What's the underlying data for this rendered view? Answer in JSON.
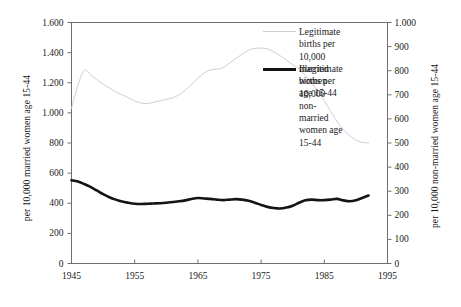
{
  "chart_data": {
    "type": "line",
    "title": "",
    "xlabel": "",
    "ylabel": "per 10,000 married women age 15-44",
    "y2label": "per 10,000 non-married women age 15-44",
    "xlim": [
      1945,
      1995
    ],
    "ylim": [
      0,
      1600
    ],
    "y2lim": [
      0,
      1000
    ],
    "grid": false,
    "legend_position": "top-right inside plot",
    "xticks": [
      1945,
      1955,
      1965,
      1975,
      1985,
      1995
    ],
    "xtick_labels": [
      "1945",
      "1955",
      "1965",
      "1975",
      "1985",
      "1995"
    ],
    "yticks": [
      0,
      200,
      400,
      600,
      800,
      1000,
      1200,
      1400,
      1600
    ],
    "ytick_labels": [
      "0",
      "200",
      "400",
      "600",
      "800",
      "1.000",
      "1.200",
      "1.400",
      "1.600"
    ],
    "y2ticks": [
      0,
      100,
      200,
      300,
      400,
      500,
      600,
      700,
      800,
      900,
      1000
    ],
    "y2tick_labels": [
      "0",
      "100",
      "200",
      "300",
      "400",
      "500",
      "600",
      "700",
      "800",
      "900",
      "1.000"
    ],
    "series": [
      {
        "name": "Legitimate births per 10,000 married women age 15-44",
        "axis": "left",
        "color": "#cfcfcf",
        "width": 1.0,
        "x": [
          1945,
          1946,
          1947,
          1948,
          1949,
          1950,
          1951,
          1952,
          1953,
          1954,
          1955,
          1956,
          1957,
          1958,
          1959,
          1960,
          1961,
          1962,
          1963,
          1964,
          1965,
          1966,
          1967,
          1968,
          1969,
          1970,
          1971,
          1972,
          1973,
          1974,
          1975,
          1976,
          1977,
          1978,
          1979,
          1980,
          1981,
          1982,
          1983,
          1984,
          1985,
          1986,
          1987,
          1988,
          1989,
          1990,
          1991,
          1992
        ],
        "values": [
          1030,
          1180,
          1282,
          1255,
          1220,
          1190,
          1165,
          1140,
          1120,
          1100,
          1080,
          1065,
          1062,
          1070,
          1080,
          1090,
          1100,
          1120,
          1150,
          1190,
          1230,
          1265,
          1285,
          1290,
          1300,
          1330,
          1360,
          1390,
          1415,
          1428,
          1430,
          1425,
          1405,
          1380,
          1350,
          1320,
          1290,
          1250,
          1200,
          1140,
          1080,
          1010,
          945,
          890,
          850,
          820,
          805,
          800
        ]
      },
      {
        "name": "Illegitimate births per 10,000 non-married women age 15-44",
        "axis": "right",
        "color": "#141414",
        "width": 2.6,
        "x": [
          1945,
          1946,
          1947,
          1948,
          1949,
          1950,
          1951,
          1952,
          1953,
          1954,
          1955,
          1956,
          1957,
          1958,
          1959,
          1960,
          1961,
          1962,
          1963,
          1964,
          1965,
          1966,
          1967,
          1968,
          1969,
          1970,
          1971,
          1972,
          1973,
          1974,
          1975,
          1976,
          1977,
          1978,
          1979,
          1980,
          1981,
          1982,
          1983,
          1984,
          1985,
          1986,
          1987,
          1988,
          1989,
          1990,
          1991,
          1992
        ],
        "values": [
          345,
          340,
          330,
          318,
          303,
          288,
          275,
          265,
          257,
          252,
          248,
          247,
          248,
          249,
          250,
          252,
          255,
          258,
          262,
          268,
          272,
          270,
          268,
          265,
          263,
          265,
          267,
          265,
          260,
          252,
          243,
          235,
          230,
          228,
          232,
          240,
          252,
          262,
          265,
          263,
          263,
          265,
          268,
          262,
          258,
          262,
          272,
          282
        ]
      }
    ]
  },
  "legend": {
    "entries": [
      {
        "key": "legitimate",
        "label": "Legitimate births per\n10,000 married women\nage 15-44",
        "color": "#cfcfcf"
      },
      {
        "key": "illegitimate",
        "label": "Illegitimate births per\n10,000 non-married\nwomen age 15-44",
        "color": "#141414"
      }
    ]
  },
  "axes": {
    "left_title": "per 10,000 married women age 15-44",
    "right_title": "per 10,000 non-married women age 15-44"
  }
}
